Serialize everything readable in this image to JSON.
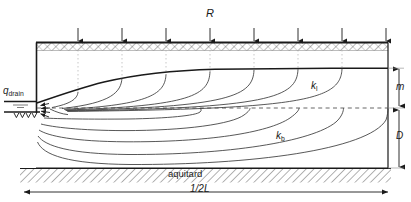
{
  "figure": {
    "labels": {
      "recharge": "R",
      "drain_discharge_main": "q",
      "drain_discharge_sub": "drain",
      "hydraulic_conductivity_top_main": "k",
      "hydraulic_conductivity_top_sub": "l",
      "hydraulic_conductivity_bottom_main": "k",
      "hydraulic_conductivity_bottom_sub": "b",
      "thickness_top": "m",
      "thickness_bottom": "D",
      "aquitard": "aquitard",
      "half_spacing": "1/2L"
    },
    "colors": {
      "line": "#1a1a1a",
      "flowline": "#3a3a3a",
      "hatch": "#4a4a4a",
      "dotted": "#9a9a9a",
      "background": "#ffffff"
    },
    "geometry": {
      "left_boundary_x": 36,
      "right_boundary_x": 388,
      "ground_surface_y": 42,
      "top_layer_base_y": 108,
      "aquitard_top_y": 168,
      "water_table_left_y": 101,
      "drain_y": 112,
      "phreatic_crest_y": 70
    },
    "recharge_arrows_x": [
      78,
      122,
      166,
      210,
      254,
      298,
      342,
      386
    ],
    "equipotential_dotted_x": [
      78,
      122,
      166,
      210,
      254,
      298,
      342
    ],
    "flowlines_note": "Curved streamlines converging on the drain at the left boundary"
  }
}
